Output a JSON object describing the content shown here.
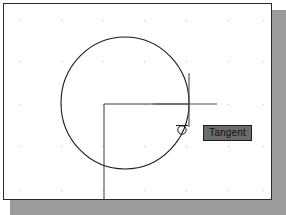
{
  "app": {
    "title": "CAD Drawing Window",
    "background_color": "#ffffff",
    "canvas_color": "#ffffff",
    "border_color": "#2b2b2b",
    "shadow_color": "#9b9b9b",
    "geometry_color": "#1a1a1a",
    "grid_dot_color": "#c9c9d6"
  },
  "tooltip": {
    "label": "Tangent",
    "background_color": "#6b6b6b",
    "border_color": "#1c1c1c",
    "text_color": "#111111"
  },
  "snap_marker": {
    "name": "tangent-snap-marker",
    "type": "tangent",
    "x": 180,
    "y": 127,
    "radius": 4
  },
  "crosshair": {
    "center_x": 188,
    "center_y": 103,
    "horizontal_start_x": 152,
    "horizontal_end_x": 216,
    "vertical_start_y": 72,
    "vertical_end_y": 126
  },
  "circle": {
    "center_x": 124,
    "center_y": 102,
    "radius_x": 64,
    "radius_y": 66
  },
  "center_lines": {
    "vertical_x": 103,
    "vertical_start_y": 103,
    "vertical_end_y": 215,
    "horizontal_y": 103,
    "horizontal_start_x": 103,
    "horizontal_end_x": 188
  },
  "grid": {
    "visible": true,
    "x_positions": [
      18,
      60,
      101,
      143,
      185,
      227,
      268
    ],
    "y_positions": [
      19,
      60,
      103,
      145,
      190
    ],
    "spacing_x": 42,
    "spacing_y": 42
  }
}
